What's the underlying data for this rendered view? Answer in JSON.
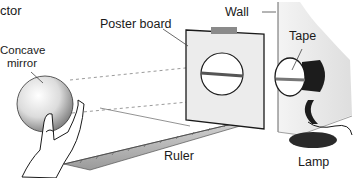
{
  "diagram": {
    "title_fragment": "ctor",
    "labels": {
      "mirror": [
        "Concave",
        "mirror"
      ],
      "poster_board": "Poster board",
      "wall": "Wall",
      "tape": "Tape",
      "ruler": "Ruler",
      "lamp": "Lamp"
    },
    "colors": {
      "wall": "#e6e6e6",
      "board": "#eeeeee",
      "tape": "#8a8a8a",
      "lamp": "#1c1c1c",
      "ruler": "#b8b8b8",
      "beam_dash": "#9a9a9a"
    }
  }
}
